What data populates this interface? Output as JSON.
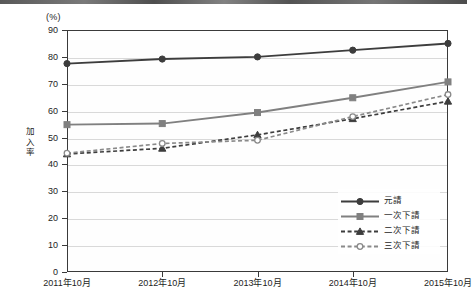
{
  "axis": {
    "unit_label": "(%)",
    "y_title_chars": [
      "加",
      "入",
      "率"
    ],
    "y_ticks": [
      "90",
      "80",
      "70",
      "60",
      "50",
      "40",
      "30",
      "20",
      "10",
      "0"
    ],
    "x_ticks": [
      "2011年10月",
      "2012年10月",
      "2013年10月",
      "2014年10月",
      "2015年10月"
    ]
  },
  "legend": {
    "items": [
      {
        "label": "元請",
        "marker": "filled-circle-marker",
        "style": "solid",
        "color": "#3d3d3d"
      },
      {
        "label": "一次下請",
        "marker": "filled-square-marker",
        "style": "solid",
        "color": "#808080"
      },
      {
        "label": "二次下請",
        "marker": "filled-triangle-marker",
        "style": "dashed",
        "color": "#3d3d3d"
      },
      {
        "label": "三次下請",
        "marker": "open-circle-marker",
        "style": "dashed",
        "color": "#8a8a8a"
      }
    ]
  },
  "chart_data": {
    "type": "line",
    "title": "",
    "xlabel": "",
    "ylabel": "加入率",
    "unit": "(%)",
    "ylim": [
      0,
      90
    ],
    "ytick_step": 10,
    "grid": true,
    "legend_position": "bottom-right",
    "categories": [
      "2011年10月",
      "2012年10月",
      "2013年10月",
      "2014年10月",
      "2015年10月"
    ],
    "series": [
      {
        "name": "元請",
        "marker": "filled-circle",
        "linestyle": "solid",
        "color": "#3d3d3d",
        "values": [
          77.5,
          79.2,
          80.0,
          82.5,
          85.0
        ]
      },
      {
        "name": "一次下請",
        "marker": "filled-square",
        "linestyle": "solid",
        "color": "#808080",
        "values": [
          54.8,
          55.2,
          59.3,
          64.8,
          70.7
        ]
      },
      {
        "name": "二次下請",
        "marker": "filled-triangle",
        "linestyle": "dashed",
        "color": "#3d3d3d",
        "values": [
          43.9,
          46.0,
          51.0,
          57.0,
          63.5
        ]
      },
      {
        "name": "三次下請",
        "marker": "open-circle",
        "linestyle": "dashed",
        "color": "#8a8a8a",
        "values": [
          44.2,
          47.8,
          49.0,
          57.8,
          66.0
        ]
      }
    ]
  }
}
